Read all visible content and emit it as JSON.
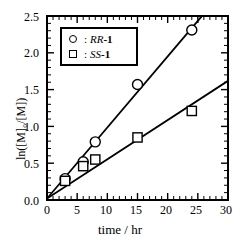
{
  "chart_data": {
    "type": "scatter",
    "title": "",
    "xlabel": "time / hr",
    "ylabel": "ln([M]0/[M])",
    "ylabel_display": "ln([M]₀/[M])",
    "xlim": [
      0,
      30
    ],
    "ylim": [
      0.0,
      2.5
    ],
    "x_major_ticks": [
      0,
      5,
      10,
      15,
      20,
      25,
      30
    ],
    "x_tick_labels": [
      "0",
      "5",
      "10",
      "15",
      "20",
      "25",
      "30"
    ],
    "x_minor_interval": 1,
    "y_major_ticks": [
      0.0,
      0.5,
      1.0,
      1.5,
      2.0,
      2.5
    ],
    "y_tick_labels": [
      "0.0",
      "0.5",
      "1.0",
      "1.5",
      "2.0",
      "2.5"
    ],
    "y_minor_interval": 0.1,
    "grid": false,
    "legend_position": "top-left-inside",
    "series": [
      {
        "name": "RR-1",
        "name_prefix": ":",
        "name_italic": "RR",
        "name_bold": "-1",
        "marker": "circle",
        "color": "#000000",
        "x": [
          3,
          6,
          8,
          15,
          24
        ],
        "y": [
          0.29,
          0.52,
          0.79,
          1.57,
          2.31
        ],
        "fit_line": {
          "slope": 0.0965,
          "intercept": 0.02,
          "x_start": 0,
          "x_end": 25.6
        }
      },
      {
        "name": "SS-1",
        "name_prefix": ":",
        "name_italic": "SS",
        "name_bold": "-1",
        "marker": "square",
        "color": "#000000",
        "x": [
          3,
          6,
          8,
          15,
          24
        ],
        "y": [
          0.26,
          0.46,
          0.55,
          0.85,
          1.21
        ],
        "fit_line": {
          "slope": 0.0533,
          "intercept": 0.02,
          "x_start": 0,
          "x_end": 30
        }
      }
    ]
  },
  "axis": {
    "x_tick_labels": [
      "0",
      "5",
      "10",
      "15",
      "20",
      "25",
      "30"
    ],
    "y_tick_labels": [
      "0.0",
      "0.5",
      "1.0",
      "1.5",
      "2.0",
      "2.5"
    ],
    "xlabel": "time / hr",
    "ylabel": "ln([M]₀/[M])"
  },
  "legend": {
    "entries": [
      {
        "symbol": "circle",
        "separator": ":",
        "italic_part": "RR",
        "bold_part": "-1"
      },
      {
        "symbol": "square",
        "separator": ":",
        "italic_part": "SS",
        "bold_part": "-1"
      }
    ]
  }
}
